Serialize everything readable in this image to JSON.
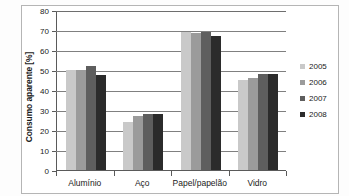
{
  "chart_data": {
    "type": "bar",
    "title": "",
    "xlabel": "",
    "ylabel": "Consumo aparente [%]",
    "categories": [
      "Alumínio",
      "Aço",
      "Papel/papelão",
      "Vidro"
    ],
    "series": [
      {
        "name": "2005",
        "color": "#c9c9c9",
        "values": [
          50.0,
          24.0,
          69.0,
          45.0
        ]
      },
      {
        "name": "2006",
        "color": "#9b9b9b",
        "values": [
          50.2,
          27.0,
          68.5,
          46.2
        ]
      },
      {
        "name": "2007",
        "color": "#5e5e5e",
        "values": [
          52.0,
          27.8,
          69.0,
          48.0
        ]
      },
      {
        "name": "2008",
        "color": "#2b2b2b",
        "values": [
          47.5,
          27.8,
          67.2,
          48.1
        ]
      }
    ],
    "ylim": [
      0,
      80
    ],
    "yticks": [
      0,
      10,
      20,
      30,
      40,
      50,
      60,
      70,
      80
    ],
    "ytick_labels": [
      "0",
      "10",
      "20",
      "30",
      "40",
      "50",
      "60",
      "70",
      "80"
    ],
    "grid": true,
    "grid_axis": "y",
    "legend_position": "right",
    "legend_entries": [
      "2005",
      "2006",
      "2007",
      "2008"
    ]
  }
}
